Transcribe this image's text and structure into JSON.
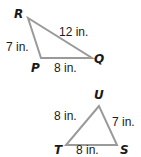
{
  "triangles": [
    {
      "name": "PQR",
      "vertices": {
        "R": {
          "label": "R",
          "x": 28,
          "y": 18
        },
        "P": {
          "label": "P",
          "x": 41,
          "y": 58
        },
        "Q": {
          "label": "Q",
          "x": 92,
          "y": 58
        }
      },
      "sides": {
        "RQ": "12 in.",
        "RP": "7 in.",
        "PQ": "8 in."
      }
    },
    {
      "name": "STU",
      "vertices": {
        "U": {
          "label": "U",
          "x": 99,
          "y": 106
        },
        "T": {
          "label": "T",
          "x": 66,
          "y": 145
        },
        "S": {
          "label": "S",
          "x": 117,
          "y": 145
        }
      },
      "sides": {
        "TU": "8 in.",
        "US": "7 in.",
        "TS": "8 in."
      }
    }
  ],
  "colors": {
    "edge": "#9a9a9a",
    "text": "#1a1a1a",
    "background": "#ffffff"
  }
}
